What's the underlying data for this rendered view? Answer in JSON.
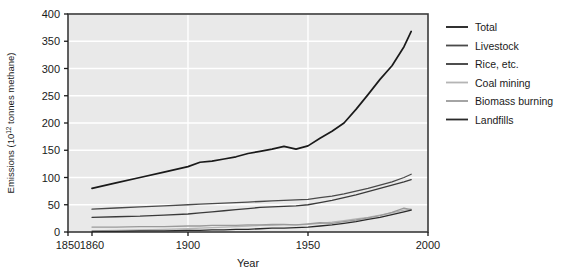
{
  "chart_data": {
    "type": "line",
    "title": "",
    "xlabel": "Year",
    "ylabel": "Emissions (10¹² tonnes methane)",
    "ylabel_prefix": "Emissions (10",
    "ylabel_exponent": "12",
    "ylabel_suffix": " tonnes methane)",
    "xlim": [
      1850,
      2000
    ],
    "ylim": [
      0,
      400
    ],
    "xticks": [
      1850,
      1860,
      1900,
      1950,
      2000
    ],
    "xtick_labels": [
      "1850",
      "1860",
      "1900",
      "1950",
      "2000"
    ],
    "yticks": [
      0,
      50,
      100,
      150,
      200,
      250,
      300,
      350,
      400
    ],
    "ytick_labels": [
      "0",
      "50",
      "100",
      "150",
      "200",
      "250",
      "300",
      "350",
      "400"
    ],
    "grid": true,
    "grid_color": "#ffffff",
    "plot_background": "#e9e9e9",
    "legend_position": "right",
    "x": [
      1860,
      1870,
      1880,
      1890,
      1900,
      1905,
      1910,
      1915,
      1920,
      1925,
      1930,
      1935,
      1940,
      1945,
      1950,
      1955,
      1960,
      1965,
      1970,
      1975,
      1980,
      1985,
      1990,
      1993
    ],
    "series": [
      {
        "name": "Total",
        "color": "#1a1a1a",
        "width": 1.7,
        "values": [
          80,
          90,
          100,
          110,
          120,
          128,
          130,
          134,
          138,
          144,
          148,
          152,
          157,
          152,
          158,
          172,
          185,
          200,
          225,
          252,
          280,
          305,
          340,
          368
        ]
      },
      {
        "name": "Livestock",
        "color": "#4a4a4a",
        "width": 1.3,
        "values": [
          42,
          44,
          46,
          48,
          50,
          51,
          52,
          53,
          54,
          55,
          56,
          57,
          58,
          59,
          60,
          63,
          66,
          70,
          75,
          80,
          86,
          92,
          100,
          106
        ]
      },
      {
        "name": "Rice, etc.",
        "color": "#3a3a3a",
        "width": 1.3,
        "values": [
          27,
          28,
          29,
          31,
          33,
          35,
          37,
          39,
          41,
          43,
          45,
          46,
          47,
          48,
          50,
          54,
          58,
          63,
          68,
          74,
          80,
          86,
          92,
          96
        ]
      },
      {
        "name": "Coal mining",
        "color": "#b5b5b5",
        "width": 1.3,
        "values": [
          2,
          3,
          4,
          5,
          6,
          7,
          8,
          9,
          10,
          11,
          12,
          12,
          13,
          13,
          14,
          16,
          18,
          21,
          24,
          27,
          31,
          35,
          40,
          42
        ]
      },
      {
        "name": "Biomass burning",
        "color": "#9a9a9a",
        "width": 1.3,
        "values": [
          9,
          9,
          10,
          10,
          11,
          11,
          12,
          12,
          12,
          13,
          13,
          14,
          14,
          13,
          15,
          17,
          16,
          19,
          22,
          26,
          30,
          36,
          44,
          41
        ]
      },
      {
        "name": "Landfills",
        "color": "#2a2a2a",
        "width": 1.3,
        "values": [
          1,
          1,
          2,
          2,
          3,
          3,
          4,
          4,
          5,
          5,
          6,
          7,
          7,
          8,
          9,
          11,
          13,
          16,
          19,
          23,
          27,
          32,
          37,
          40
        ]
      }
    ]
  },
  "legend": {
    "items": [
      {
        "label": "Total",
        "color": "#1a1a1a"
      },
      {
        "label": "Livestock",
        "color": "#4a4a4a"
      },
      {
        "label": "Rice, etc.",
        "color": "#3a3a3a"
      },
      {
        "label": "Coal mining",
        "color": "#b5b5b5"
      },
      {
        "label": "Biomass burning",
        "color": "#9a9a9a"
      },
      {
        "label": "Landfills",
        "color": "#2a2a2a"
      }
    ]
  }
}
